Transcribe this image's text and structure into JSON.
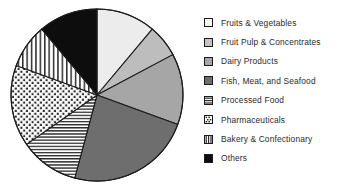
{
  "chart_data": {
    "type": "pie",
    "title": "",
    "legend_position": "right",
    "categories": [
      "Fruits & Vegetables",
      "Fruit Pulp & Concentrates",
      "Dairy Products",
      "Fish, Meat, and Seafood",
      "Processed Food",
      "Pharmaceuticals",
      "Bakery & Confectionary",
      "Others"
    ],
    "values": [
      11,
      6,
      13,
      24,
      11,
      15,
      9,
      11
    ],
    "units": "percent",
    "slices": [
      {
        "label": "Fruits & Vegetables",
        "value": 11,
        "start_angle": 0,
        "end_angle": 40,
        "fill": "#ececec",
        "pattern": "solid",
        "swatch": "light-gray-swatch"
      },
      {
        "label": "Fruit Pulp & Concentrates",
        "value": 6,
        "start_angle": 40,
        "end_angle": 62,
        "fill": "#bdbdbd",
        "pattern": "solid",
        "swatch": "gray-swatch"
      },
      {
        "label": "Dairy Products",
        "value": 13,
        "start_angle": 62,
        "end_angle": 110,
        "fill": "#a6a6a6",
        "pattern": "solid",
        "swatch": "medium-gray-swatch"
      },
      {
        "label": "Fish, Meat, and Seafood",
        "value": 24,
        "start_angle": 110,
        "end_angle": 195,
        "fill": "#6e6e6e",
        "pattern": "solid",
        "swatch": "dark-gray-swatch"
      },
      {
        "label": "Processed Food",
        "value": 11,
        "start_angle": 195,
        "end_angle": 235,
        "fill": "#ffffff",
        "pattern": "horizontal-lines",
        "swatch": "horizontal-lines-swatch"
      },
      {
        "label": "Pharmaceuticals",
        "value": 15,
        "start_angle": 235,
        "end_angle": 290,
        "fill": "#ffffff",
        "pattern": "dotted",
        "swatch": "dotted-swatch"
      },
      {
        "label": "Bakery & Confectionary",
        "value": 9,
        "start_angle": 290,
        "end_angle": 320,
        "fill": "#ffffff",
        "pattern": "vertical-lines",
        "swatch": "vertical-lines-swatch"
      },
      {
        "label": "Others",
        "value": 11,
        "start_angle": 320,
        "end_angle": 360,
        "fill": "#0d0d0d",
        "pattern": "solid",
        "swatch": "black-swatch"
      }
    ],
    "geometry": {
      "center_x": 97,
      "center_y": 95,
      "radius": 86
    },
    "colors": {
      "outline": "#1c1c1c",
      "background": "#ffffff",
      "text": "#2a2a2a"
    }
  },
  "legend": {
    "items": [
      {
        "label": "Fruits & Vegetables"
      },
      {
        "label": "Fruit Pulp & Concentrates"
      },
      {
        "label": "Dairy Products"
      },
      {
        "label": "Fish, Meat, and Seafood"
      },
      {
        "label": "Processed Food"
      },
      {
        "label": "Pharmaceuticals"
      },
      {
        "label": "Bakery & Confectionary"
      },
      {
        "label": "Others"
      }
    ]
  }
}
